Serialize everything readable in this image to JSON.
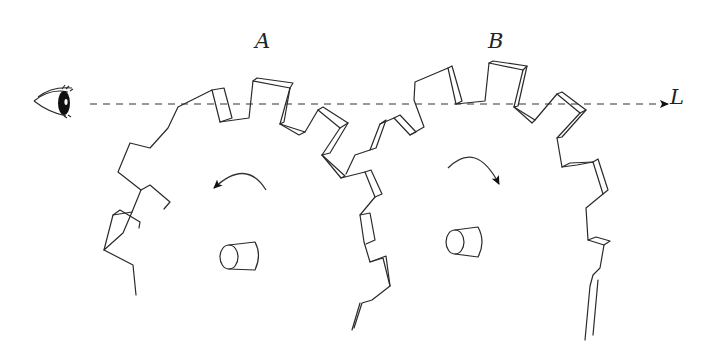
{
  "figure": {
    "labels": {
      "gear_a": "A",
      "gear_b": "B",
      "line": "L"
    },
    "elements": {
      "observer": "eye-icon",
      "sight_line": "dashed line with arrow pointing right",
      "gear_a_rotation": "counterclockwise",
      "gear_b_rotation": "clockwise"
    },
    "colors": {
      "stroke": "#2a2a2a",
      "background": "#ffffff"
    }
  }
}
